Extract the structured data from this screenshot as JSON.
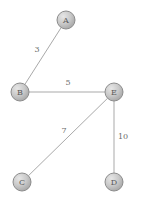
{
  "figure": {
    "name": "weighted-undirected-graph",
    "background_color": "#ffffff",
    "width": 143,
    "height": 204
  },
  "style": {
    "node_fill_light": "#e2e2e2",
    "node_fill_mid": "#c6c6c6",
    "node_fill_dark": "#a8a8a8",
    "node_stroke": "#8c8c8c",
    "edge_stroke": "#a9a9a9",
    "node_label_color": "#5a5a5a",
    "edge_label_color": "#6b6b6b",
    "node_radius": 9
  },
  "chart_data": {
    "type": "diagram",
    "graph_type": "weighted-undirected-graph",
    "title": "",
    "nodes": [
      {
        "id": "A",
        "label": "A",
        "x": 66,
        "y": 20
      },
      {
        "id": "B",
        "label": "B",
        "x": 20,
        "y": 92
      },
      {
        "id": "C",
        "label": "C",
        "x": 22,
        "y": 182
      },
      {
        "id": "D",
        "label": "D",
        "x": 114,
        "y": 182
      },
      {
        "id": "E",
        "label": "E",
        "x": 114,
        "y": 92
      }
    ],
    "edges": [
      {
        "id": "A-B",
        "source": "A",
        "target": "B",
        "weight": 3,
        "label": "3",
        "label_x": 37,
        "label_y": 49
      },
      {
        "id": "B-E",
        "source": "B",
        "target": "E",
        "weight": 5,
        "label": "5",
        "label_x": 68,
        "label_y": 82
      },
      {
        "id": "C-E",
        "source": "C",
        "target": "E",
        "weight": 7,
        "label": "7",
        "label_x": 64,
        "label_y": 130
      },
      {
        "id": "D-E",
        "source": "D",
        "target": "E",
        "weight": 10,
        "label": "10",
        "label_x": 123,
        "label_y": 136
      }
    ],
    "legend": [],
    "annotations": []
  }
}
